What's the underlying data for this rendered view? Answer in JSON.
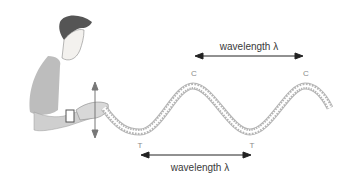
{
  "diagram": {
    "labels": {
      "top_wavelength": "wavelength λ",
      "bottom_wavelength": "wavelength λ",
      "crest_1": "C",
      "crest_2": "C",
      "trough_1": "T",
      "trough_2": "T"
    },
    "colors": {
      "spring": "#9a9a9a",
      "arrow": "#222222",
      "text": "#3a3a3a",
      "marker": "#8a8a8a",
      "figure": "#b8b8b8"
    }
  }
}
